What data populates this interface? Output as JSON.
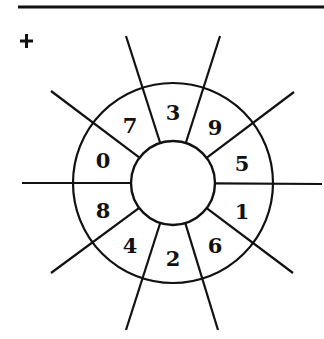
{
  "diagram": {
    "title": "",
    "marker": "+",
    "center": [
      173,
      183
    ],
    "inner_radius": 42,
    "outer_radius": 100,
    "stroke_color": "#111111",
    "top_rule": {
      "x1": 18,
      "x2": 324,
      "y": 7
    },
    "rays": [
      {
        "x2": 126,
        "y2": 36
      },
      {
        "x2": 220,
        "y2": 36
      },
      {
        "x2": 51,
        "y2": 91
      },
      {
        "x2": 294,
        "y2": 92
      },
      {
        "x2": 22,
        "y2": 183
      },
      {
        "x2": 322,
        "y2": 184
      },
      {
        "x2": 51,
        "y2": 273
      },
      {
        "x2": 293,
        "y2": 273
      },
      {
        "x2": 126,
        "y2": 330
      },
      {
        "x2": 218,
        "y2": 330
      }
    ],
    "segments": [
      {
        "label": "3",
        "x": 173,
        "y": 112
      },
      {
        "label": "9",
        "x": 215,
        "y": 127
      },
      {
        "label": "5",
        "x": 242,
        "y": 163
      },
      {
        "label": "1",
        "x": 242,
        "y": 211
      },
      {
        "label": "6",
        "x": 215,
        "y": 245
      },
      {
        "label": "2",
        "x": 173,
        "y": 258
      },
      {
        "label": "4",
        "x": 130,
        "y": 245
      },
      {
        "label": "8",
        "x": 103,
        "y": 210
      },
      {
        "label": "0",
        "x": 103,
        "y": 160
      },
      {
        "label": "7",
        "x": 130,
        "y": 125
      }
    ]
  }
}
